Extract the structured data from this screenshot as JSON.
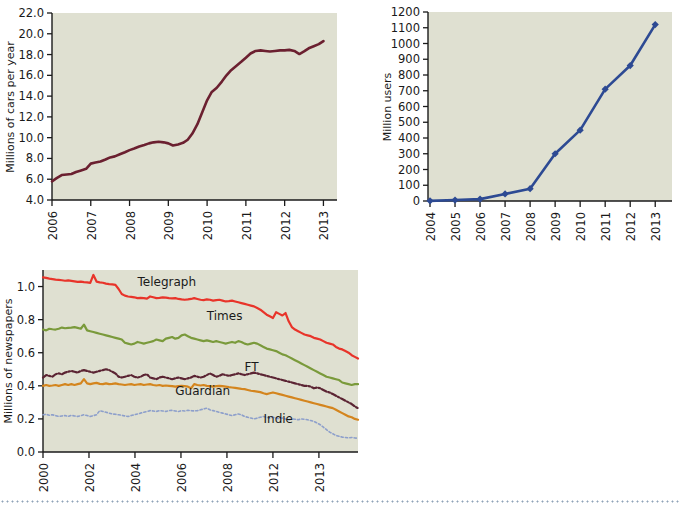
{
  "page": {
    "background_color": "#ffffff",
    "plot_background_color": "#dfe0d1",
    "axis_color": "#1a1a1a",
    "separator": {
      "name": "dotted-rule",
      "color": "#8fa3b8"
    }
  },
  "chart_data": [
    {
      "id": "cars-per-year",
      "type": "line",
      "title": "",
      "xlabel": "",
      "ylabel": "Millions of cars per year",
      "xlim": [
        2006,
        2013.35
      ],
      "ylim": [
        4.0,
        22.0
      ],
      "grid": false,
      "legend": "none",
      "line_color": "#6b2030",
      "line_width": 2.6,
      "xticks": [
        "2006",
        "2007",
        "2008",
        "2009",
        "2010",
        "2011",
        "2012",
        "2013"
      ],
      "yticks": [
        "4.0",
        "6.0",
        "8.0",
        "10.0",
        "12.0",
        "14.0",
        "16.0",
        "18.0",
        "20.0",
        "22.0"
      ],
      "x": [
        2006.0,
        2006.12,
        2006.25,
        2006.38,
        2006.5,
        2006.62,
        2006.75,
        2006.88,
        2007.0,
        2007.12,
        2007.25,
        2007.38,
        2007.5,
        2007.62,
        2007.75,
        2007.88,
        2008.0,
        2008.12,
        2008.25,
        2008.38,
        2008.5,
        2008.62,
        2008.75,
        2008.88,
        2009.0,
        2009.12,
        2009.25,
        2009.38,
        2009.5,
        2009.62,
        2009.75,
        2009.88,
        2010.0,
        2010.12,
        2010.25,
        2010.38,
        2010.5,
        2010.62,
        2010.75,
        2010.88,
        2011.0,
        2011.12,
        2011.25,
        2011.38,
        2011.5,
        2011.62,
        2011.75,
        2011.88,
        2012.0,
        2012.12,
        2012.25,
        2012.38,
        2012.5,
        2012.62,
        2012.75,
        2012.88,
        2013.0
      ],
      "values": [
        5.8,
        6.1,
        6.4,
        6.45,
        6.5,
        6.7,
        6.85,
        7.0,
        7.5,
        7.6,
        7.7,
        7.9,
        8.1,
        8.2,
        8.4,
        8.6,
        8.8,
        8.95,
        9.15,
        9.3,
        9.45,
        9.55,
        9.6,
        9.55,
        9.45,
        9.25,
        9.35,
        9.5,
        9.8,
        10.4,
        11.3,
        12.5,
        13.6,
        14.4,
        14.8,
        15.4,
        16.0,
        16.5,
        16.9,
        17.3,
        17.7,
        18.1,
        18.35,
        18.4,
        18.35,
        18.3,
        18.35,
        18.4,
        18.4,
        18.45,
        18.35,
        18.05,
        18.3,
        18.6,
        18.8,
        19.0,
        19.3
      ]
    },
    {
      "id": "million-users",
      "type": "line",
      "title": "",
      "xlabel": "",
      "ylabel": "Million users",
      "xlim": [
        2004,
        2013
      ],
      "ylim": [
        0,
        1200
      ],
      "grid": false,
      "legend": "none",
      "line_color": "#2d4a93",
      "line_width": 2.6,
      "marker": "diamond",
      "xticks": [
        "2004",
        "2005",
        "2006",
        "2007",
        "2008",
        "2009",
        "2010",
        "2011",
        "2012",
        "2013"
      ],
      "yticks": [
        "0",
        "100",
        "200",
        "300",
        "400",
        "500",
        "600",
        "700",
        "800",
        "900",
        "1000",
        "1100",
        "1200"
      ],
      "x": [
        2004,
        2005,
        2006,
        2007,
        2008,
        2009,
        2010,
        2011,
        2012,
        2013
      ],
      "values": [
        1,
        6,
        12,
        45,
        78,
        300,
        450,
        710,
        860,
        1120
      ]
    },
    {
      "id": "millions-of-newspapers",
      "type": "line",
      "title": "",
      "xlabel": "",
      "ylabel": "Millions of newspapers",
      "xlim": [
        0,
        100
      ],
      "ylim": [
        0.0,
        1.1
      ],
      "grid": false,
      "legend": "inline-labels",
      "xticks": [
        "2000",
        "2002",
        "2004",
        "2006",
        "2008",
        "2012",
        "2013"
      ],
      "yticks": [
        "0.0",
        "0.2",
        "0.4",
        "0.6",
        "0.8",
        "1.0"
      ],
      "series": [
        {
          "name": "Telegraph",
          "color": "#e8342a",
          "style": "solid",
          "label_x": 30,
          "label_y": 1.005,
          "values": [
            1.055,
            1.052,
            1.048,
            1.045,
            1.042,
            1.04,
            1.038,
            1.035,
            1.037,
            1.034,
            1.031,
            1.028,
            1.03,
            1.027,
            1.025,
            1.022,
            1.07,
            1.03,
            1.025,
            1.023,
            1.018,
            1.015,
            1.013,
            1.01,
            0.985,
            0.955,
            0.945,
            0.94,
            0.938,
            0.935,
            0.93,
            0.932,
            0.93,
            0.927,
            0.94,
            0.935,
            0.93,
            0.932,
            0.935,
            0.933,
            0.93,
            0.928,
            0.93,
            0.925,
            0.922,
            0.92,
            0.922,
            0.925,
            0.93,
            0.925,
            0.92,
            0.918,
            0.922,
            0.92,
            0.915,
            0.918,
            0.92,
            0.915,
            0.91,
            0.912,
            0.915,
            0.91,
            0.905,
            0.9,
            0.895,
            0.89,
            0.885,
            0.88,
            0.87,
            0.86,
            0.845,
            0.83,
            0.82,
            0.81,
            0.845,
            0.835,
            0.825,
            0.84,
            0.79,
            0.755,
            0.74,
            0.73,
            0.72,
            0.71,
            0.705,
            0.7,
            0.69,
            0.685,
            0.68,
            0.67,
            0.66,
            0.655,
            0.65,
            0.635,
            0.625,
            0.62,
            0.61,
            0.6,
            0.585,
            0.575,
            0.565
          ]
        },
        {
          "name": "Times",
          "color": "#7a9a3b",
          "style": "solid",
          "label_x": 52,
          "label_y": 0.795,
          "values": [
            0.74,
            0.735,
            0.745,
            0.742,
            0.74,
            0.745,
            0.752,
            0.748,
            0.75,
            0.752,
            0.755,
            0.75,
            0.745,
            0.77,
            0.735,
            0.73,
            0.725,
            0.72,
            0.715,
            0.71,
            0.705,
            0.7,
            0.695,
            0.69,
            0.685,
            0.68,
            0.66,
            0.655,
            0.65,
            0.655,
            0.665,
            0.66,
            0.655,
            0.66,
            0.665,
            0.67,
            0.68,
            0.675,
            0.67,
            0.685,
            0.69,
            0.695,
            0.685,
            0.69,
            0.705,
            0.71,
            0.7,
            0.69,
            0.685,
            0.68,
            0.675,
            0.67,
            0.675,
            0.67,
            0.665,
            0.67,
            0.665,
            0.66,
            0.655,
            0.66,
            0.665,
            0.66,
            0.67,
            0.665,
            0.655,
            0.65,
            0.655,
            0.66,
            0.655,
            0.645,
            0.635,
            0.625,
            0.62,
            0.615,
            0.61,
            0.6,
            0.59,
            0.585,
            0.575,
            0.565,
            0.555,
            0.545,
            0.535,
            0.525,
            0.515,
            0.505,
            0.495,
            0.485,
            0.475,
            0.465,
            0.455,
            0.45,
            0.445,
            0.44,
            0.435,
            0.42,
            0.415,
            0.41,
            0.405,
            0.41,
            0.41
          ]
        },
        {
          "name": "FT",
          "color": "#5b2433",
          "style": "dash-dot",
          "label_x": 64,
          "label_y": 0.49,
          "values": [
            0.45,
            0.465,
            0.46,
            0.455,
            0.47,
            0.475,
            0.47,
            0.48,
            0.485,
            0.49,
            0.485,
            0.48,
            0.49,
            0.495,
            0.49,
            0.485,
            0.48,
            0.485,
            0.49,
            0.495,
            0.5,
            0.495,
            0.485,
            0.475,
            0.455,
            0.45,
            0.455,
            0.46,
            0.465,
            0.455,
            0.45,
            0.455,
            0.465,
            0.47,
            0.45,
            0.445,
            0.44,
            0.45,
            0.455,
            0.45,
            0.445,
            0.44,
            0.445,
            0.45,
            0.445,
            0.44,
            0.445,
            0.45,
            0.46,
            0.455,
            0.45,
            0.455,
            0.465,
            0.475,
            0.465,
            0.455,
            0.46,
            0.47,
            0.465,
            0.46,
            0.465,
            0.47,
            0.475,
            0.47,
            0.465,
            0.47,
            0.475,
            0.48,
            0.475,
            0.47,
            0.465,
            0.46,
            0.455,
            0.45,
            0.445,
            0.44,
            0.435,
            0.43,
            0.425,
            0.42,
            0.415,
            0.41,
            0.405,
            0.4,
            0.4,
            0.395,
            0.385,
            0.39,
            0.385,
            0.375,
            0.365,
            0.36,
            0.35,
            0.34,
            0.33,
            0.32,
            0.31,
            0.3,
            0.29,
            0.275,
            0.265
          ]
        },
        {
          "name": "Guardian",
          "color": "#d4851e",
          "style": "solid",
          "label_x": 42,
          "label_y": 0.345,
          "values": [
            0.4,
            0.405,
            0.4,
            0.402,
            0.405,
            0.4,
            0.405,
            0.41,
            0.405,
            0.41,
            0.405,
            0.41,
            0.415,
            0.44,
            0.415,
            0.41,
            0.415,
            0.418,
            0.412,
            0.41,
            0.415,
            0.41,
            0.412,
            0.415,
            0.41,
            0.408,
            0.405,
            0.408,
            0.41,
            0.405,
            0.408,
            0.41,
            0.405,
            0.408,
            0.41,
            0.405,
            0.402,
            0.405,
            0.4,
            0.402,
            0.4,
            0.398,
            0.395,
            0.398,
            0.4,
            0.398,
            0.395,
            0.385,
            0.41,
            0.405,
            0.402,
            0.405,
            0.4,
            0.398,
            0.395,
            0.398,
            0.4,
            0.398,
            0.395,
            0.392,
            0.39,
            0.388,
            0.385,
            0.382,
            0.38,
            0.375,
            0.37,
            0.368,
            0.365,
            0.362,
            0.355,
            0.35,
            0.355,
            0.36,
            0.355,
            0.35,
            0.345,
            0.34,
            0.335,
            0.33,
            0.325,
            0.32,
            0.315,
            0.31,
            0.305,
            0.3,
            0.295,
            0.29,
            0.285,
            0.28,
            0.275,
            0.27,
            0.265,
            0.255,
            0.245,
            0.235,
            0.225,
            0.215,
            0.21,
            0.2,
            0.195
          ]
        },
        {
          "name": "Indie",
          "color": "#8d9fcb",
          "style": "dotted",
          "label_x": 70,
          "label_y": 0.175,
          "values": [
            0.225,
            0.228,
            0.222,
            0.225,
            0.22,
            0.215,
            0.218,
            0.22,
            0.215,
            0.222,
            0.218,
            0.215,
            0.22,
            0.225,
            0.22,
            0.215,
            0.22,
            0.225,
            0.25,
            0.245,
            0.24,
            0.235,
            0.23,
            0.228,
            0.225,
            0.222,
            0.218,
            0.215,
            0.22,
            0.225,
            0.23,
            0.235,
            0.24,
            0.245,
            0.25,
            0.248,
            0.245,
            0.25,
            0.248,
            0.245,
            0.25,
            0.252,
            0.248,
            0.245,
            0.25,
            0.248,
            0.252,
            0.25,
            0.248,
            0.25,
            0.255,
            0.26,
            0.265,
            0.255,
            0.25,
            0.245,
            0.24,
            0.235,
            0.23,
            0.225,
            0.22,
            0.225,
            0.23,
            0.225,
            0.215,
            0.21,
            0.205,
            0.2,
            0.205,
            0.21,
            0.215,
            0.21,
            0.205,
            0.21,
            0.205,
            0.2,
            0.205,
            0.2,
            0.195,
            0.2,
            0.198,
            0.195,
            0.2,
            0.198,
            0.195,
            0.19,
            0.185,
            0.175,
            0.165,
            0.15,
            0.135,
            0.12,
            0.11,
            0.1,
            0.095,
            0.09,
            0.088,
            0.085,
            0.088,
            0.085,
            0.082
          ]
        }
      ]
    }
  ]
}
